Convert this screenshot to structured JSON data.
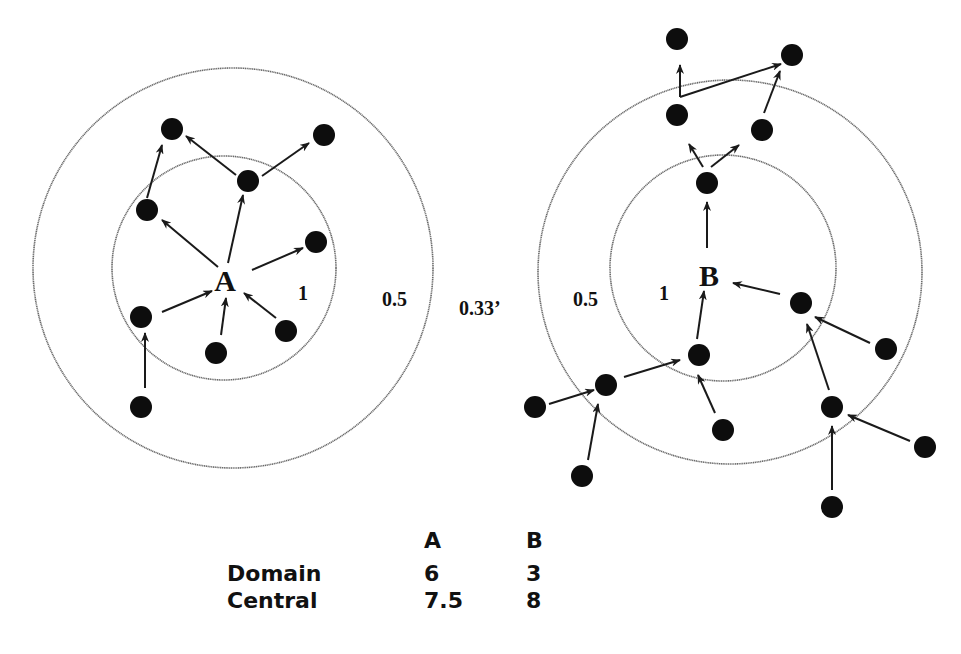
{
  "diagram": {
    "actors": [
      {
        "id": "A",
        "label": "A",
        "center": [
          225,
          280
        ],
        "rings": [
          {
            "label": "1",
            "cx": 224,
            "cy": 268,
            "r": 112
          },
          {
            "label": "0.5",
            "cx": 233,
            "cy": 268,
            "r": 200
          }
        ],
        "ring_label_positions": {
          "inner": [
            298,
            300
          ],
          "outer": [
            382,
            306
          ]
        },
        "nodes": [
          [
            172,
            129
          ],
          [
            324,
            135
          ],
          [
            248,
            181
          ],
          [
            147,
            210
          ],
          [
            316,
            242
          ],
          [
            141,
            317
          ],
          [
            216,
            353
          ],
          [
            286,
            331
          ],
          [
            141,
            407
          ]
        ],
        "edges": [
          [
            [
              218,
              267
            ],
            [
              162,
              220
            ]
          ],
          [
            [
              228,
              263
            ],
            [
              243,
              195
            ]
          ],
          [
            [
              252,
              270
            ],
            [
              303,
              248
            ]
          ],
          [
            [
              162,
              312
            ],
            [
              212,
              291
            ]
          ],
          [
            [
              221,
              335
            ],
            [
              226,
              298
            ]
          ],
          [
            [
              276,
              318
            ],
            [
              244,
              293
            ]
          ],
          [
            [
              147,
              198
            ],
            [
              162,
              145
            ]
          ],
          [
            [
              236,
              175
            ],
            [
              186,
              136
            ]
          ],
          [
            [
              262,
              176
            ],
            [
              309,
              143
            ]
          ],
          [
            [
              145,
              388
            ],
            [
              145,
              333
            ]
          ]
        ]
      },
      {
        "id": "B",
        "label": "B",
        "center": [
          709,
          275
        ],
        "rings": [
          {
            "label": "1",
            "cx": 723,
            "cy": 268,
            "r": 113
          },
          {
            "label": "0.5",
            "cx": 730,
            "cy": 272,
            "r": 192
          }
        ],
        "ring_label_positions": {
          "inner": [
            659,
            300
          ],
          "outer": [
            573,
            306
          ]
        },
        "nodes": [
          [
            677,
            39
          ],
          [
            792,
            55
          ],
          [
            677,
            115
          ],
          [
            762,
            130
          ],
          [
            707,
            183
          ],
          [
            801,
            303
          ],
          [
            699,
            355
          ],
          [
            606,
            385
          ],
          [
            886,
            349
          ],
          [
            535,
            407
          ],
          [
            723,
            430
          ],
          [
            832,
            407
          ],
          [
            582,
            476
          ],
          [
            925,
            447
          ],
          [
            832,
            507
          ]
        ],
        "edges": [
          [
            [
              707,
              248
            ],
            [
              707,
              202
            ]
          ],
          [
            [
              703,
              167
            ],
            [
              689,
              144
            ]
          ],
          [
            [
              711,
              167
            ],
            [
              739,
              145
            ]
          ],
          [
            [
              680,
              97
            ],
            [
              680,
              65
            ]
          ],
          [
            [
              680,
              97
            ],
            [
              781,
              64
            ]
          ],
          [
            [
              764,
              113
            ],
            [
              780,
              71
            ]
          ],
          [
            [
              780,
              294
            ],
            [
              733,
              283
            ]
          ],
          [
            [
              697,
              339
            ],
            [
              704,
              291
            ]
          ],
          [
            [
              624,
              377
            ],
            [
              680,
              360
            ]
          ],
          [
            [
              549,
              404
            ],
            [
              594,
              390
            ]
          ],
          [
            [
              588,
              460
            ],
            [
              598,
              404
            ]
          ],
          [
            [
              715,
              413
            ],
            [
              698,
              375
            ]
          ],
          [
            [
              870,
              343
            ],
            [
              815,
              317
            ]
          ],
          [
            [
              829,
              390
            ],
            [
              807,
              324
            ]
          ],
          [
            [
              910,
              441
            ],
            [
              848,
              415
            ]
          ],
          [
            [
              832,
              490
            ],
            [
              832,
              426
            ]
          ]
        ]
      }
    ],
    "gap_label": {
      "text": "0.33’",
      "position": [
        459,
        315
      ]
    }
  },
  "table": {
    "columns": [
      "A",
      "B"
    ],
    "rows": [
      {
        "label": "Domain",
        "values": [
          "6",
          "3"
        ]
      },
      {
        "label": "Central",
        "values": [
          "7.5",
          "8"
        ]
      }
    ]
  },
  "colors": {
    "node": "#0d0d0d",
    "ring": "#6a6a6a",
    "edge": "#1a1a1a",
    "background": "#ffffff"
  }
}
